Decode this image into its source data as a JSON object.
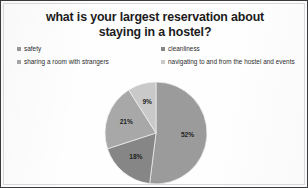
{
  "chart_data": {
    "type": "pie",
    "title": "what is your largest reservation about staying in a hostel?",
    "title_lines": [
      "what is your largest reservation about",
      "staying in a hostel?"
    ],
    "categories": [
      "safety",
      "cleanliness",
      "sharing a room with strangers",
      "navigating to and from the hostel and events"
    ],
    "values": [
      52,
      18,
      21,
      9
    ],
    "value_labels": [
      "52%",
      "18%",
      "21%",
      "9%"
    ],
    "unit": "%",
    "start_angle_deg": 0,
    "direction": "clockwise",
    "legend_position": "top",
    "legend_columns": 2,
    "grid": false,
    "xlabel": "",
    "ylabel": "",
    "slice_colors": [
      "#9b9b9b",
      "#868686",
      "#a8a8a8",
      "#c9c9c9"
    ],
    "slices": [
      {
        "label": "safety",
        "value": 52,
        "display": "52%",
        "color": "#9b9b9b"
      },
      {
        "label": "cleanliness",
        "value": 18,
        "display": "18%",
        "color": "#868686"
      },
      {
        "label": "sharing a room with strangers",
        "value": 21,
        "display": "21%",
        "color": "#a8a8a8"
      },
      {
        "label": "navigating to and from the hostel and events",
        "value": 9,
        "display": "9%",
        "color": "#c9c9c9"
      }
    ]
  },
  "legend": {
    "items": [
      {
        "label": "safety",
        "color": "#9b9b9b",
        "marker": "square-marker"
      },
      {
        "label": "cleanliness",
        "color": "#868686",
        "marker": "square-marker"
      },
      {
        "label": "sharing a room with strangers",
        "color": "#a8a8a8",
        "marker": "square-marker"
      },
      {
        "label": "navigating to and from the hostel and events",
        "color": "#c9c9c9",
        "marker": "square-marker"
      }
    ]
  },
  "style": {
    "border_color": "#3a3a3c",
    "background": "#fefefe",
    "title_color": "#1c1c1c",
    "label_color": "#1f1f1f"
  }
}
